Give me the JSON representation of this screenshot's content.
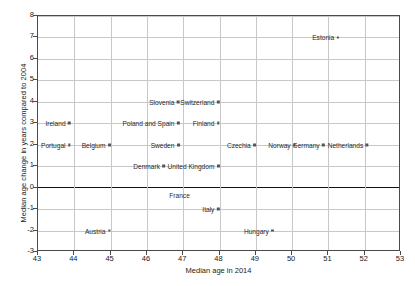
{
  "chart_data": {
    "type": "scatter",
    "title": "",
    "xlabel": "Median age in 2014",
    "ylabel": "Median age change in years compared to 2004",
    "xlim": [
      43,
      53
    ],
    "ylim": [
      -3,
      8
    ],
    "xticks": [
      43,
      44,
      45,
      46,
      47,
      48,
      49,
      50,
      51,
      52,
      53
    ],
    "yticks": [
      8,
      7,
      6,
      5,
      4,
      3,
      2,
      1,
      0,
      -1,
      -2,
      -3
    ],
    "grid": true,
    "legend": "none",
    "zero_line": 0,
    "points": [
      {
        "label": "Estonia",
        "x": 51.3,
        "y": 7,
        "label_side": "left"
      },
      {
        "label": "Slovenia",
        "x": 46.9,
        "y": 4,
        "label_side": "left"
      },
      {
        "label": "Switzerland",
        "x": 48.0,
        "y": 4,
        "label_side": "left"
      },
      {
        "label": "Ireland",
        "x": 43.9,
        "y": 3,
        "label_side": "left"
      },
      {
        "label": "Poland and Spain",
        "x": 46.9,
        "y": 3,
        "label_side": "left"
      },
      {
        "label": "Finland",
        "x": 48.0,
        "y": 3,
        "label_side": "left"
      },
      {
        "label": "Portugal",
        "x": 43.9,
        "y": 2,
        "label_side": "left"
      },
      {
        "label": "Belgium",
        "x": 45.0,
        "y": 2,
        "label_side": "left"
      },
      {
        "label": "Sweden",
        "x": 46.9,
        "y": 2,
        "label_side": "left"
      },
      {
        "label": "Czechia",
        "x": 49.0,
        "y": 2,
        "label_side": "left"
      },
      {
        "label": "Norway",
        "x": 50.1,
        "y": 2,
        "label_side": "left"
      },
      {
        "label": "Germany",
        "x": 50.9,
        "y": 2,
        "label_side": "left"
      },
      {
        "label": "Netherlands",
        "x": 52.1,
        "y": 2,
        "label_side": "left"
      },
      {
        "label": "Denmark",
        "x": 46.5,
        "y": 1,
        "label_side": "left"
      },
      {
        "label": "United Kingdom",
        "x": 48.0,
        "y": 1,
        "label_side": "left"
      },
      {
        "label": "France",
        "x": 46.9,
        "y": 0,
        "label_side": "below"
      },
      {
        "label": "Italy",
        "x": 48.0,
        "y": -1,
        "label_side": "left"
      },
      {
        "label": "Austria",
        "x": 45.0,
        "y": -2,
        "label_side": "left"
      },
      {
        "label": "Hungary",
        "x": 49.5,
        "y": -2,
        "label_side": "left"
      }
    ]
  }
}
